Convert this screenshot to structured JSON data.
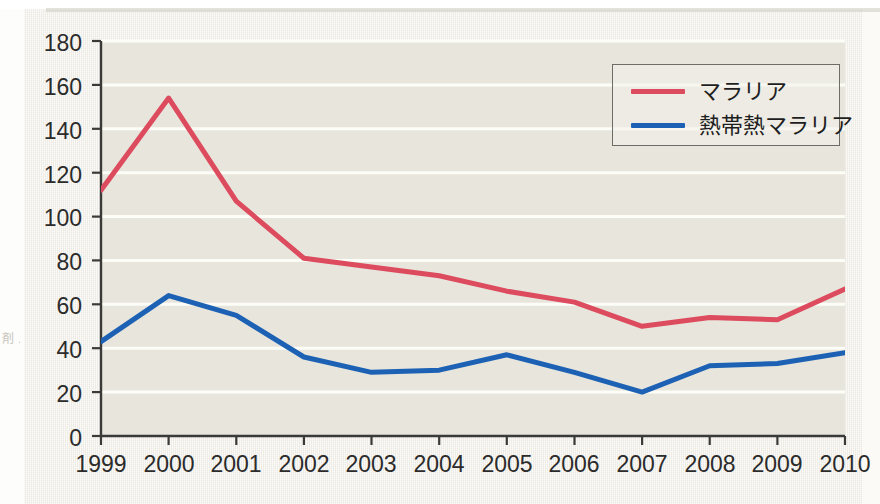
{
  "edge_caption": "剤\nノ\nヽ\nメ",
  "legend": {
    "position": "top-right",
    "entries": [
      {
        "label": "マラリア",
        "color": "#dd4b5e",
        "icon": "line-swatch-red"
      },
      {
        "label": "熱帯熱マラリア",
        "color": "#1c61b4",
        "icon": "line-swatch-blue"
      }
    ]
  },
  "axes": {
    "y_ticks": [
      "0",
      "20",
      "40",
      "60",
      "80",
      "100",
      "120",
      "140",
      "160",
      "180"
    ],
    "x_ticks": [
      "1999",
      "2000",
      "2001",
      "2002",
      "2003",
      "2004",
      "2005",
      "2006",
      "2007",
      "2008",
      "2009",
      "2010"
    ]
  },
  "colors": {
    "red": "#dd4b5e",
    "blue": "#1c61b4",
    "axis": "#3a3a38",
    "gridline": "#fdfdf8",
    "plot_background": "#e7e5dc",
    "page_background": "#f2f0e8"
  },
  "chart_data": {
    "type": "line",
    "title": "",
    "xlabel": "",
    "ylabel": "",
    "x": [
      1999,
      2000,
      2001,
      2002,
      2003,
      2004,
      2005,
      2006,
      2007,
      2008,
      2009,
      2010
    ],
    "categories": [
      "1999",
      "2000",
      "2001",
      "2002",
      "2003",
      "2004",
      "2005",
      "2006",
      "2007",
      "2008",
      "2009",
      "2010"
    ],
    "series": [
      {
        "name": "マラリア",
        "color": "#dd4b5e",
        "values": [
          112,
          154,
          107,
          81,
          77,
          73,
          66,
          61,
          50,
          54,
          53,
          67
        ]
      },
      {
        "name": "熱帯熱マラリア",
        "color": "#1c61b4",
        "values": [
          43,
          64,
          55,
          36,
          29,
          30,
          37,
          29,
          20,
          32,
          33,
          38
        ]
      }
    ],
    "ylim": [
      0,
      180
    ],
    "ytick_step": 20,
    "xlim": [
      1999,
      2010
    ],
    "grid": "horizontal",
    "legend_position": "top-right"
  }
}
